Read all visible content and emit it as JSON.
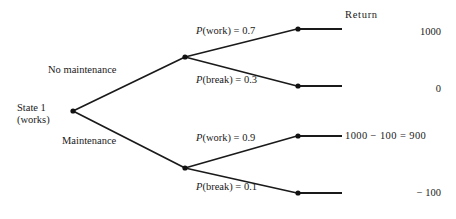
{
  "diagram": {
    "type": "decision-tree",
    "root": {
      "label_line1": "State 1",
      "label_line2": "(works)"
    },
    "return_header": "Return",
    "decisions": [
      {
        "label": "No maintenance"
      },
      {
        "label": "Maintenance"
      }
    ],
    "branches": [
      {
        "decision": "No maintenance",
        "prob_var": "P",
        "prob_text": "(work) = 0.7",
        "prob_full": "P(work) = 0.7",
        "probability": 0.7,
        "outcome": "work",
        "return_display": "1000",
        "return_value": 1000
      },
      {
        "decision": "No maintenance",
        "prob_var": "P",
        "prob_text": "(break) = 0.3",
        "prob_full": "P(break) = 0.3",
        "probability": 0.3,
        "outcome": "break",
        "return_display": "0",
        "return_value": 0
      },
      {
        "decision": "Maintenance",
        "prob_var": "P",
        "prob_text": "(work) = 0.9",
        "prob_full": "P(work) = 0.9",
        "probability": 0.9,
        "outcome": "work",
        "return_display": "1000 − 100 = 900",
        "return_value": 900
      },
      {
        "decision": "Maintenance",
        "prob_var": "P",
        "prob_text": "(break) = 0.1",
        "prob_full": "P(break) = 0.1",
        "probability": 0.1,
        "outcome": "break",
        "return_display": "− 100",
        "return_value": -100
      }
    ],
    "colors": {
      "line": "#1a1a1a",
      "node": "#111111",
      "text": "#1a1a1a",
      "background": "#ffffff"
    }
  }
}
